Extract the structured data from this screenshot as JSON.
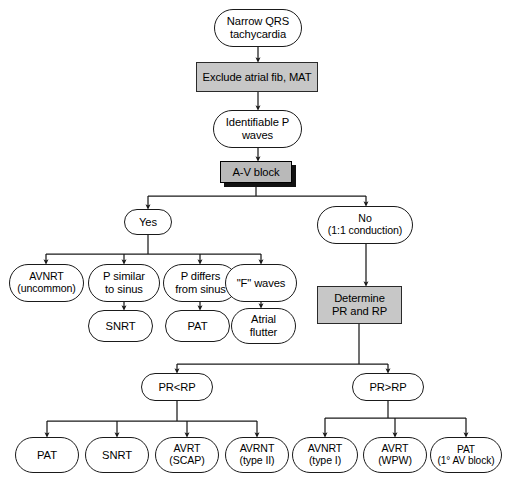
{
  "diagram": {
    "colors": {
      "shaded_fill": "#c7c7c7",
      "shadow_fill": "#b9b9b9",
      "stroke": "#1a1a1a",
      "background": "#ffffff",
      "text": "#000000"
    },
    "nodes": [
      {
        "id": "start",
        "label": "Narrow QRS\ntachycardia",
        "shape": "pill",
        "style": "plain",
        "x": 214,
        "y": 9,
        "w": 88,
        "h": 38,
        "size": "t13"
      },
      {
        "id": "exclude",
        "label": "Exclude atrial fib, MAT",
        "shape": "rect",
        "style": "shaded",
        "x": 196,
        "y": 62,
        "w": 122,
        "h": 30,
        "size": "t13"
      },
      {
        "id": "identifiable",
        "label": "Identifiable P\nwaves",
        "shape": "pill",
        "style": "plain",
        "x": 213,
        "y": 110,
        "w": 89,
        "h": 38,
        "size": "t13"
      },
      {
        "id": "avblock",
        "label": "A-V block",
        "shape": "rect",
        "style": "shaded-shadow",
        "x": 220,
        "y": 161,
        "w": 72,
        "h": 22,
        "size": "t13"
      },
      {
        "id": "yes",
        "label": "Yes",
        "shape": "pill",
        "style": "plain",
        "x": 124,
        "y": 209,
        "w": 48,
        "h": 26,
        "size": "t13"
      },
      {
        "id": "no",
        "label": "No\n(1:1 conduction)",
        "shape": "pill",
        "style": "plain",
        "x": 317,
        "y": 206,
        "w": 96,
        "h": 38,
        "size": "t12"
      },
      {
        "id": "avnrt_uncommon",
        "label": "AVNRT\n(uncommon)",
        "shape": "pill",
        "style": "plain",
        "x": 9,
        "y": 264,
        "w": 75,
        "h": 38,
        "size": "t12"
      },
      {
        "id": "p_similar",
        "label": "P similar\nto sinus",
        "shape": "pill",
        "style": "plain",
        "x": 88,
        "y": 264,
        "w": 72,
        "h": 38,
        "size": "t13"
      },
      {
        "id": "p_differs",
        "label": "P differs\nfrom sinus",
        "shape": "pill",
        "style": "plain",
        "x": 163,
        "y": 264,
        "w": 75,
        "h": 38,
        "size": "t13"
      },
      {
        "id": "f_waves",
        "label": "\"F\" waves",
        "shape": "pill",
        "style": "plain",
        "x": 225,
        "y": 264,
        "w": 72,
        "h": 38,
        "size": "t13"
      },
      {
        "id": "snrt1",
        "label": "SNRT",
        "shape": "pill",
        "style": "plain",
        "x": 88,
        "y": 310,
        "w": 65,
        "h": 32,
        "size": "t13"
      },
      {
        "id": "pat1",
        "label": "PAT",
        "shape": "pill",
        "style": "plain",
        "x": 165,
        "y": 310,
        "w": 65,
        "h": 32,
        "size": "t13"
      },
      {
        "id": "atrial_flutter",
        "label": "Atrial\nflutter",
        "shape": "pill",
        "style": "plain",
        "x": 231,
        "y": 308,
        "w": 65,
        "h": 36,
        "size": "t13"
      },
      {
        "id": "determine",
        "label": "Determine\nPR and RP",
        "shape": "rect",
        "style": "shaded",
        "x": 317,
        "y": 286,
        "w": 85,
        "h": 38,
        "size": "t13"
      },
      {
        "id": "pr_lt_rp",
        "label": "PR<RP",
        "shape": "pill",
        "style": "plain",
        "x": 141,
        "y": 373,
        "w": 72,
        "h": 28,
        "size": "t13"
      },
      {
        "id": "pr_gt_rp",
        "label": "PR>RP",
        "shape": "pill",
        "style": "plain",
        "x": 352,
        "y": 373,
        "w": 72,
        "h": 28,
        "size": "t13"
      },
      {
        "id": "pat2",
        "label": "PAT",
        "shape": "pill",
        "style": "plain",
        "x": 15,
        "y": 437,
        "w": 64,
        "h": 36,
        "size": "t13"
      },
      {
        "id": "snrt2",
        "label": "SNRT",
        "shape": "pill",
        "style": "plain",
        "x": 85,
        "y": 437,
        "w": 64,
        "h": 36,
        "size": "t13"
      },
      {
        "id": "avrt_scap",
        "label": "AVRT\n(SCAP)",
        "shape": "pill",
        "style": "plain",
        "x": 155,
        "y": 437,
        "w": 64,
        "h": 36,
        "size": "t12"
      },
      {
        "id": "avrnt_type2",
        "label": "AVRNT\n(type II)",
        "shape": "pill",
        "style": "plain",
        "x": 225,
        "y": 437,
        "w": 64,
        "h": 36,
        "size": "t12"
      },
      {
        "id": "avnrt_type1",
        "label": "AVNRT\n(type I)",
        "shape": "pill",
        "style": "plain",
        "x": 292,
        "y": 437,
        "w": 66,
        "h": 36,
        "size": "t12"
      },
      {
        "id": "avrt_wpw",
        "label": "AVRT\n(WPW)",
        "shape": "pill",
        "style": "plain",
        "x": 363,
        "y": 437,
        "w": 64,
        "h": 36,
        "size": "t12"
      },
      {
        "id": "pat_av_block",
        "label": "PAT\n(1° AV block)",
        "shape": "pill",
        "style": "plain",
        "x": 430,
        "y": 437,
        "w": 72,
        "h": 36,
        "size": "t11"
      }
    ],
    "edges": [
      {
        "from": "start",
        "to": "exclude",
        "kind": "vertical"
      },
      {
        "from": "exclude",
        "to": "identifiable",
        "kind": "vertical"
      },
      {
        "from": "identifiable",
        "to": "avblock",
        "kind": "vertical"
      },
      {
        "from": "avblock",
        "to": "yes",
        "kind": "branch"
      },
      {
        "from": "avblock",
        "to": "no",
        "kind": "branch"
      },
      {
        "from": "yes",
        "to": "avnrt_uncommon",
        "kind": "branch"
      },
      {
        "from": "yes",
        "to": "p_similar",
        "kind": "branch"
      },
      {
        "from": "yes",
        "to": "p_differs",
        "kind": "branch"
      },
      {
        "from": "yes",
        "to": "f_waves",
        "kind": "branch"
      },
      {
        "from": "p_similar",
        "to": "snrt1",
        "kind": "vertical"
      },
      {
        "from": "p_differs",
        "to": "pat1",
        "kind": "vertical"
      },
      {
        "from": "f_waves",
        "to": "atrial_flutter",
        "kind": "vertical"
      },
      {
        "from": "no",
        "to": "determine",
        "kind": "vertical"
      },
      {
        "from": "determine",
        "to": "pr_lt_rp",
        "kind": "branch"
      },
      {
        "from": "determine",
        "to": "pr_gt_rp",
        "kind": "branch"
      },
      {
        "from": "pr_lt_rp",
        "to": "pat2",
        "kind": "branch"
      },
      {
        "from": "pr_lt_rp",
        "to": "snrt2",
        "kind": "branch"
      },
      {
        "from": "pr_lt_rp",
        "to": "avrt_scap",
        "kind": "branch"
      },
      {
        "from": "pr_lt_rp",
        "to": "avrnt_type2",
        "kind": "branch"
      },
      {
        "from": "pr_gt_rp",
        "to": "avnrt_type1",
        "kind": "branch"
      },
      {
        "from": "pr_gt_rp",
        "to": "avrt_wpw",
        "kind": "branch"
      },
      {
        "from": "pr_gt_rp",
        "to": "pat_av_block",
        "kind": "branch"
      }
    ]
  }
}
